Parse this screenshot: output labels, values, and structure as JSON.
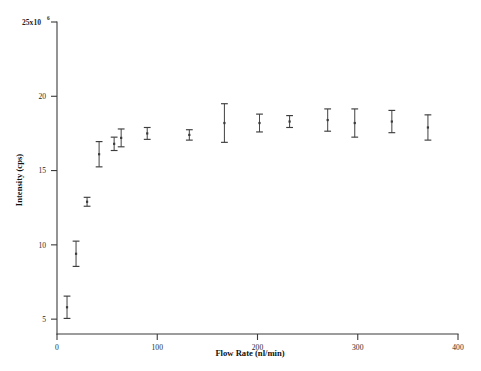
{
  "chart_data": {
    "type": "scatter",
    "title": "",
    "xlabel": "Flow Rate (nl/min)",
    "ylabel": "Intensity (cps)",
    "y_axis_multiplier_label": "25x10",
    "y_axis_multiplier_exponent": "6",
    "xlim": [
      0,
      400
    ],
    "ylim": [
      4,
      25
    ],
    "xticks": [
      0,
      100,
      200,
      300,
      400
    ],
    "xtick_labels": [
      "0",
      "100",
      "200",
      "300",
      "400"
    ],
    "yticks": [
      5,
      10,
      15,
      20,
      25
    ],
    "ytick_labels": [
      "5",
      "10",
      "15",
      "20",
      "25x10"
    ],
    "grid": false,
    "legend": "none",
    "error_bars": "symmetric vertical",
    "x": [
      10,
      19,
      30,
      42,
      57,
      64,
      90,
      132,
      167,
      202,
      232,
      270,
      297,
      334,
      370
    ],
    "y": [
      5.8,
      9.4,
      12.9,
      16.1,
      16.8,
      17.2,
      17.5,
      17.4,
      18.2,
      18.2,
      18.3,
      18.4,
      18.2,
      18.3,
      17.9
    ],
    "yerr": [
      0.75,
      0.85,
      0.3,
      0.85,
      0.45,
      0.6,
      0.4,
      0.35,
      1.3,
      0.6,
      0.4,
      0.75,
      0.95,
      0.75,
      0.85
    ],
    "points": [
      {
        "x": 10,
        "y": 5.8,
        "yerr": 0.75
      },
      {
        "x": 19,
        "y": 9.4,
        "yerr": 0.85
      },
      {
        "x": 30,
        "y": 12.9,
        "yerr": 0.3
      },
      {
        "x": 42,
        "y": 16.1,
        "yerr": 0.85
      },
      {
        "x": 57,
        "y": 16.8,
        "yerr": 0.45
      },
      {
        "x": 64,
        "y": 17.2,
        "yerr": 0.6
      },
      {
        "x": 90,
        "y": 17.5,
        "yerr": 0.4
      },
      {
        "x": 132,
        "y": 17.4,
        "yerr": 0.35
      },
      {
        "x": 167,
        "y": 18.2,
        "yerr": 1.3
      },
      {
        "x": 202,
        "y": 18.2,
        "yerr": 0.6
      },
      {
        "x": 232,
        "y": 18.3,
        "yerr": 0.4
      },
      {
        "x": 270,
        "y": 18.4,
        "yerr": 0.75
      },
      {
        "x": 297,
        "y": 18.2,
        "yerr": 0.95
      },
      {
        "x": 334,
        "y": 18.3,
        "yerr": 0.75
      },
      {
        "x": 370,
        "y": 17.9,
        "yerr": 0.85
      }
    ],
    "colors": {
      "axis": "#3b3b3b",
      "marker": "#3a3a3a",
      "errorbar": "#4a4a4a",
      "background": "#ffffff",
      "text": "#1a1a1a"
    }
  },
  "figure": {
    "caption": "",
    "background_color": "#ffffff"
  }
}
